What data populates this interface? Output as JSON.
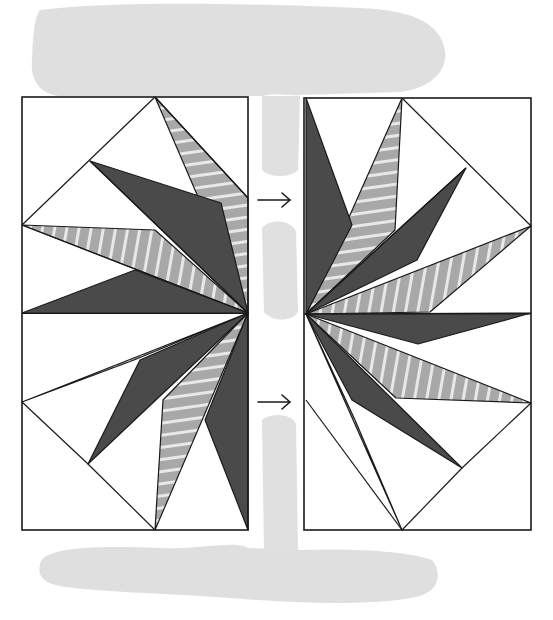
{
  "colors": {
    "paper": "#ffffff",
    "wash": "#d9d9d9",
    "wash_light": "#e6e6e6",
    "dark": "#4a4a4a",
    "stripe_base": "#a8a8a8",
    "stripe_line": "#e8e8e8",
    "ink": "#1a1a1a",
    "faint": "#f4f4f4"
  },
  "wash": {
    "top": "M40,10 C120,0 260,4 360,8 C410,10 440,22 445,50 C448,72 430,88 400,92 L300,95 C285,96 275,92 262,96 L60,96 C40,94 30,80 32,60 C33,35 34,18 40,10 Z",
    "bottom": "M40,565 C40,548 90,545 160,548 C200,550 236,540 248,548 L300,550 C360,548 410,552 432,560 C442,572 440,590 420,596 C380,606 300,604 230,598 C150,592 80,592 52,584 C40,580 38,572 40,565 Z",
    "gap_top": "M262,96 L300,96 L298,170 C290,178 270,178 262,170 Z",
    "gap_mid": "M262,228 C270,218 292,220 296,232 L298,312 C292,322 272,322 264,312 Z",
    "gap_low": "M262,420 C272,412 292,414 296,424 L298,550 L264,550 Z"
  },
  "left_panel": {
    "frame": [
      22,
      97,
      226,
      433
    ],
    "stripes_dir": "vertical",
    "dark_points": [
      "90,161 248,313 221,203",
      "22,313 248,313 135,270",
      "88,464 248,313 140,360",
      "248,313 248,530 205,420"
    ],
    "stripe_points_h": [
      "155,97 248,313 248,198",
      "155,530 248,313 163,400"
    ],
    "stripe_points_v": [
      "22,225 248,313 155,230",
      "22,402 248,313 134,360"
    ],
    "lines": [
      "155,97 22,225",
      "90,161 248,313",
      "22,225 248,313",
      "22,402 88,464",
      "88,464 155,530",
      "155,97 248,198"
    ]
  },
  "right_panel": {
    "frame": [
      304,
      98,
      227,
      432
    ],
    "dark_points": [
      "306,98 306,314 352,225",
      "466,168 306,314 417,260",
      "531,313 306,314 418,344",
      "306,314 462,468 352,400"
    ],
    "stripe_points_h": [
      "402,98 306,314 395,230",
      "306,314 402,530 355,420"
    ],
    "stripe_points_v": [
      "531,226 306,314 430,312",
      "306,314 531,403 396,398"
    ],
    "lines": [
      "402,98 531,226",
      "466,168 306,314",
      "531,403 462,468",
      "462,468 402,530",
      "306,400 402,530"
    ]
  },
  "arrows": [
    {
      "x1": 258,
      "y1": 200,
      "x2": 290,
      "y2": 200,
      "label": "→"
    },
    {
      "x1": 258,
      "y1": 402,
      "x2": 290,
      "y2": 402,
      "label": "→"
    }
  ]
}
